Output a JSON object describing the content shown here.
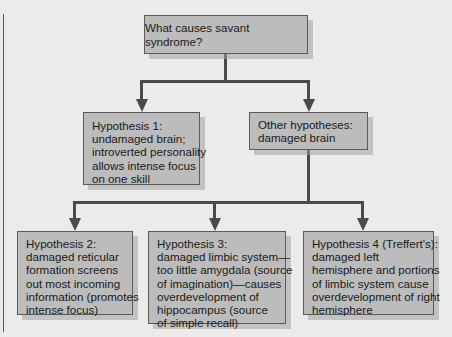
{
  "diagram": {
    "type": "tree-flowchart",
    "colors": {
      "background": "#ebebea",
      "box_fill": "#bcbcbc",
      "box_border": "#5a5a5a",
      "connector": "#4a4a4a",
      "text": "#1a1a1a"
    },
    "root": {
      "label": "What causes savant syndrome?"
    },
    "level1": [
      {
        "id": "hypothesis-1",
        "lines": [
          "Hypothesis 1:",
          "undamaged brain;",
          "introverted personality",
          "allows intense focus",
          "on one skill"
        ]
      },
      {
        "id": "other-hypotheses",
        "lines": [
          "Other hypotheses:",
          "damaged brain"
        ]
      }
    ],
    "level2": [
      {
        "id": "hypothesis-2",
        "lines": [
          "Hypothesis 2:",
          "damaged reticular",
          "formation screens",
          "out most incoming",
          "information (promotes",
          "intense focus)"
        ]
      },
      {
        "id": "hypothesis-3",
        "lines": [
          "Hypothesis 3:",
          "damaged limbic system—",
          "too little amygdala (source",
          "of imagination)—causes",
          "overdevelopment of",
          "hippocampus (source",
          "of simple recall)"
        ]
      },
      {
        "id": "hypothesis-4",
        "lines": [
          "Hypothesis 4 (Treffert's):",
          "damaged left",
          "hemisphere and portions",
          "of limbic system cause",
          "overdevelopment of right",
          "hemisphere"
        ]
      }
    ],
    "edges": [
      {
        "from": "root",
        "to": "hypothesis-1"
      },
      {
        "from": "root",
        "to": "other-hypotheses"
      },
      {
        "from": "other-hypotheses",
        "to": "hypothesis-2"
      },
      {
        "from": "other-hypotheses",
        "to": "hypothesis-3"
      },
      {
        "from": "other-hypotheses",
        "to": "hypothesis-4"
      }
    ]
  }
}
